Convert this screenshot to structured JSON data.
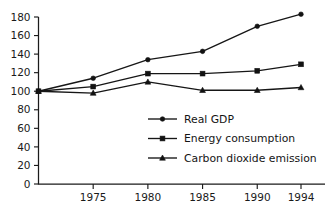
{
  "chart_data": {
    "type": "line",
    "title": "",
    "subtitle": "",
    "xlabel": "",
    "ylabel": "",
    "x": [
      1970,
      1975,
      1980,
      1985,
      1990,
      1994
    ],
    "categories": [
      "1970",
      "1975",
      "1980",
      "1985",
      "1990",
      "1994"
    ],
    "xtick_labels": [
      "1975",
      "1980",
      "1985",
      "1990",
      "1994"
    ],
    "xtick_values": [
      1975,
      1980,
      1985,
      1990,
      1994
    ],
    "ytick_labels": [
      "0",
      "20",
      "40",
      "60",
      "80",
      "100",
      "120",
      "140",
      "160",
      "180"
    ],
    "ytick_values": [
      0,
      20,
      40,
      60,
      80,
      100,
      120,
      140,
      160,
      180
    ],
    "xlim": [
      1970,
      1994
    ],
    "ylim": [
      0,
      180
    ],
    "grid": false,
    "legend_position": "center",
    "series": [
      {
        "name": "Real GDP",
        "marker": "circle",
        "color": "#121212",
        "values": [
          100,
          114,
          134,
          143,
          170,
          183
        ]
      },
      {
        "name": "Energy consumption",
        "marker": "square",
        "color": "#121212",
        "values": [
          100,
          105,
          119,
          119,
          122,
          129
        ]
      },
      {
        "name": "Carbon dioxide emission",
        "marker": "triangle",
        "color": "#121212",
        "values": [
          100,
          98,
          110,
          101,
          101,
          104
        ]
      }
    ]
  },
  "legend": {
    "items": [
      {
        "label": "Real GDP",
        "marker": "circle"
      },
      {
        "label": "Energy consumption",
        "marker": "square"
      },
      {
        "label": "Carbon dioxide emission",
        "marker": "triangle"
      }
    ]
  },
  "axes": {
    "y_tick_labels": [
      "180",
      "160",
      "140",
      "120",
      "100",
      "80",
      "60",
      "40",
      "20",
      "0"
    ],
    "x_tick_labels": [
      "1975",
      "1980",
      "1985",
      "1990",
      "1994"
    ]
  }
}
